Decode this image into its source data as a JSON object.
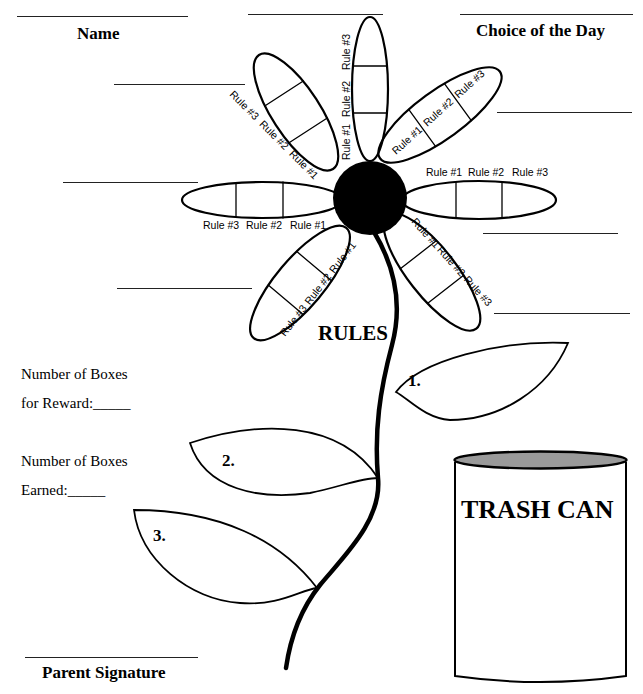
{
  "header": {
    "name_label": "Name",
    "choice_label": "Choice of the Day"
  },
  "flower": {
    "title": "RULES",
    "rule_labels": [
      "Rule #1",
      "Rule #2",
      "Rule #3"
    ],
    "petal_count": 7,
    "boxes_per_petal": 3
  },
  "leaves": [
    "1.",
    "2.",
    "3."
  ],
  "rewards": {
    "boxes_for_reward_line1": "Number of Boxes",
    "boxes_for_reward_line2": "for Reward:_____",
    "boxes_earned_line1": "Number of Boxes",
    "boxes_earned_line2": "Earned:_____"
  },
  "trash_can": {
    "label": "TRASH CAN",
    "lid_color": "#9a9a9a"
  },
  "footer": {
    "signature_label": "Parent Signature"
  },
  "colors": {
    "ink": "#000000",
    "background": "#ffffff"
  }
}
